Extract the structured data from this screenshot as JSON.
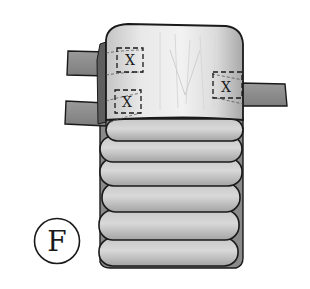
{
  "figure": {
    "label": "F",
    "colors": {
      "background": "#ffffff",
      "outline": "#1a1a1a",
      "tab_fill": "#8c8c8c",
      "pad_fill": "#e2e2e2",
      "roll_fill": "#b9b9b9",
      "roll_highlight": "#d4d4d4",
      "shadow": "#6e6e6e"
    },
    "markers": [
      {
        "id": "marker-top-left",
        "symbol": "X"
      },
      {
        "id": "marker-bottom-left",
        "symbol": "X"
      },
      {
        "id": "marker-right",
        "symbol": "X"
      }
    ],
    "tabs": [
      {
        "id": "tab-left-upper"
      },
      {
        "id": "tab-left-lower"
      },
      {
        "id": "tab-right"
      }
    ],
    "roll_count": 6
  }
}
